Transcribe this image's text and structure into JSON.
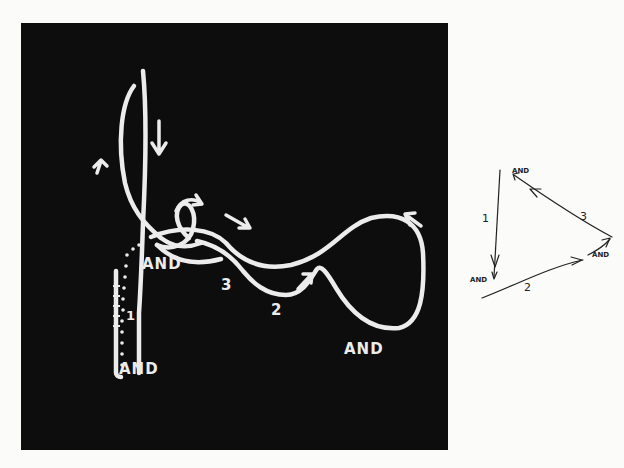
{
  "figure": {
    "panel": {
      "background": "#0d0d0d",
      "stroke_color": "#ececec",
      "labels": [
        {
          "id": "and-upper-left",
          "text": "AND"
        },
        {
          "id": "and-bottom-left",
          "text": "AND"
        },
        {
          "id": "and-bottom-right",
          "text": "AND"
        },
        {
          "id": "num-1",
          "text": "1"
        },
        {
          "id": "num-2",
          "text": "2"
        },
        {
          "id": "num-3",
          "text": "3"
        }
      ]
    },
    "schematic": {
      "stroke_color": "#222222",
      "labels": [
        {
          "id": "and-top",
          "text": "AND"
        },
        {
          "id": "and-left",
          "text": "AND"
        },
        {
          "id": "and-right",
          "text": "AND"
        },
        {
          "id": "edge-1",
          "text": "1"
        },
        {
          "id": "edge-2",
          "text": "2"
        },
        {
          "id": "edge-3",
          "text": "3"
        }
      ]
    }
  }
}
